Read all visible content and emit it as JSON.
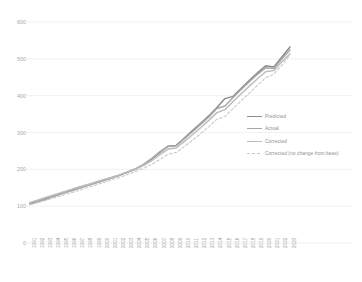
{
  "chart_data": {
    "type": "line",
    "title": "",
    "xlabel": "",
    "ylabel": "",
    "ylim": [
      0,
      600
    ],
    "yticks": [
      0,
      100,
      200,
      300,
      400,
      500,
      600
    ],
    "grid": true,
    "legend_position": "center-right",
    "categories": [
      "1991",
      "1992",
      "1993",
      "1994",
      "1995",
      "1996",
      "1997",
      "1998",
      "1999",
      "2000",
      "2001",
      "2002",
      "2003",
      "2004",
      "2005",
      "2006",
      "2007",
      "2008",
      "2009",
      "2010",
      "2011",
      "2012",
      "2013",
      "2014",
      "2015",
      "2016",
      "2017",
      "2018",
      "2019",
      "2020",
      "2021",
      "2022",
      "2023"
    ],
    "series": [
      {
        "name": "Predicted",
        "color": "#8b8b8b",
        "style": "solid",
        "values": [
          108,
          115,
          122,
          129,
          136,
          143,
          150,
          157,
          163,
          170,
          177,
          184,
          192,
          200,
          212,
          228,
          246,
          263,
          265,
          285,
          305,
          325,
          345,
          368,
          392,
          398,
          420,
          442,
          462,
          481,
          478,
          505,
          532
        ]
      },
      {
        "name": "Actual",
        "color": "#a8a8a8",
        "style": "solid",
        "values": [
          105,
          112,
          119,
          127,
          134,
          141,
          148,
          155,
          162,
          169,
          176,
          184,
          193,
          202,
          214,
          230,
          248,
          262,
          264,
          283,
          302,
          322,
          342,
          365,
          372,
          395,
          417,
          438,
          458,
          476,
          474,
          500,
          524
        ]
      },
      {
        "name": "Corrected",
        "color": "#bdbdbd",
        "style": "solid",
        "values": [
          110,
          117,
          124,
          131,
          138,
          145,
          152,
          158,
          165,
          172,
          178,
          185,
          193,
          201,
          211,
          224,
          240,
          255,
          258,
          276,
          294,
          313,
          333,
          354,
          362,
          384,
          405,
          426,
          446,
          465,
          468,
          492,
          514
        ]
      },
      {
        "name": "Corrected (no change from base)",
        "color": "#c9c9c9",
        "style": "dashed",
        "values": [
          104,
          110,
          116,
          123,
          129,
          136,
          143,
          150,
          157,
          164,
          171,
          178,
          186,
          194,
          203,
          214,
          227,
          241,
          246,
          262,
          279,
          297,
          316,
          336,
          344,
          365,
          386,
          407,
          428,
          449,
          458,
          482,
          511
        ]
      }
    ]
  },
  "yaxis": {
    "labels": [
      "600",
      "500",
      "400",
      "300",
      "200",
      "100",
      "0"
    ]
  },
  "legend": {
    "items": [
      {
        "label": "Predicted"
      },
      {
        "label": "Actual"
      },
      {
        "label": "Corrected"
      },
      {
        "label": "Corrected (no change from base)"
      }
    ]
  },
  "colors": {
    "predicted": "#8b8b8b",
    "actual": "#a8a8a8",
    "corrected": "#bdbdbd",
    "corrected_no_change": "#c9c9c9",
    "grid": "#e8e8e8",
    "tick_text": "#a6a6a6",
    "background": "#ffffff"
  }
}
